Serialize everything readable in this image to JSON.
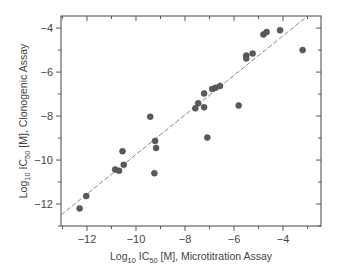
{
  "chart_data": {
    "type": "scatter",
    "title": "",
    "xlabel": "Log10 IC50 [M], Microtitration Assay",
    "ylabel": "Log10 IC50 [M], Clonogenic Assay",
    "xlabel_parts": {
      "pre": "Log",
      "sub1": "10",
      "mid": " IC",
      "sub2": "50",
      "post": " [M], Microtitration Assay"
    },
    "ylabel_parts": {
      "pre": "Log",
      "sub1": "10",
      "mid": " IC",
      "sub2": "50",
      "post": " [M], Clonogenic Assay"
    },
    "xlim": [
      -13.06,
      -2.45
    ],
    "ylim": [
      -13.0,
      -3.45
    ],
    "xticks": [
      -12,
      -10,
      -8,
      -6,
      -4
    ],
    "yticks": [
      -12,
      -10,
      -8,
      -6,
      -4
    ],
    "xtick_labels": [
      "−12",
      "−10",
      "−8",
      "−6",
      "−4"
    ],
    "ytick_labels": [
      "−12",
      "−10",
      "−8",
      "−6",
      "−4"
    ],
    "minor_step": 1,
    "grid": false,
    "legend": null,
    "marker_color": "#5a5a5a",
    "line_color": "#8a8a8a",
    "points": [
      {
        "x": -12.3,
        "y": -12.2
      },
      {
        "x": -12.03,
        "y": -11.64
      },
      {
        "x": -10.85,
        "y": -10.43
      },
      {
        "x": -10.69,
        "y": -10.49
      },
      {
        "x": -10.5,
        "y": -10.22
      },
      {
        "x": -10.55,
        "y": -9.6
      },
      {
        "x": -9.25,
        "y": -10.6
      },
      {
        "x": -9.42,
        "y": -8.03
      },
      {
        "x": -9.22,
        "y": -9.13
      },
      {
        "x": -9.18,
        "y": -9.45
      },
      {
        "x": -7.58,
        "y": -7.65
      },
      {
        "x": -7.46,
        "y": -7.42
      },
      {
        "x": -7.22,
        "y": -7.6
      },
      {
        "x": -7.22,
        "y": -6.97
      },
      {
        "x": -7.09,
        "y": -8.98
      },
      {
        "x": -6.89,
        "y": -6.77
      },
      {
        "x": -6.75,
        "y": -6.71
      },
      {
        "x": -6.57,
        "y": -6.63
      },
      {
        "x": -5.81,
        "y": -7.52
      },
      {
        "x": -5.5,
        "y": -5.25
      },
      {
        "x": -5.5,
        "y": -5.38
      },
      {
        "x": -5.24,
        "y": -5.16
      },
      {
        "x": -4.8,
        "y": -4.29
      },
      {
        "x": -4.67,
        "y": -4.18
      },
      {
        "x": -4.12,
        "y": -4.1
      },
      {
        "x": -3.2,
        "y": -5.0
      }
    ],
    "fit_line": {
      "style": "dashed",
      "x1": -13.06,
      "y1": -12.5,
      "x2": -3.0,
      "y2": -3.45
    }
  }
}
